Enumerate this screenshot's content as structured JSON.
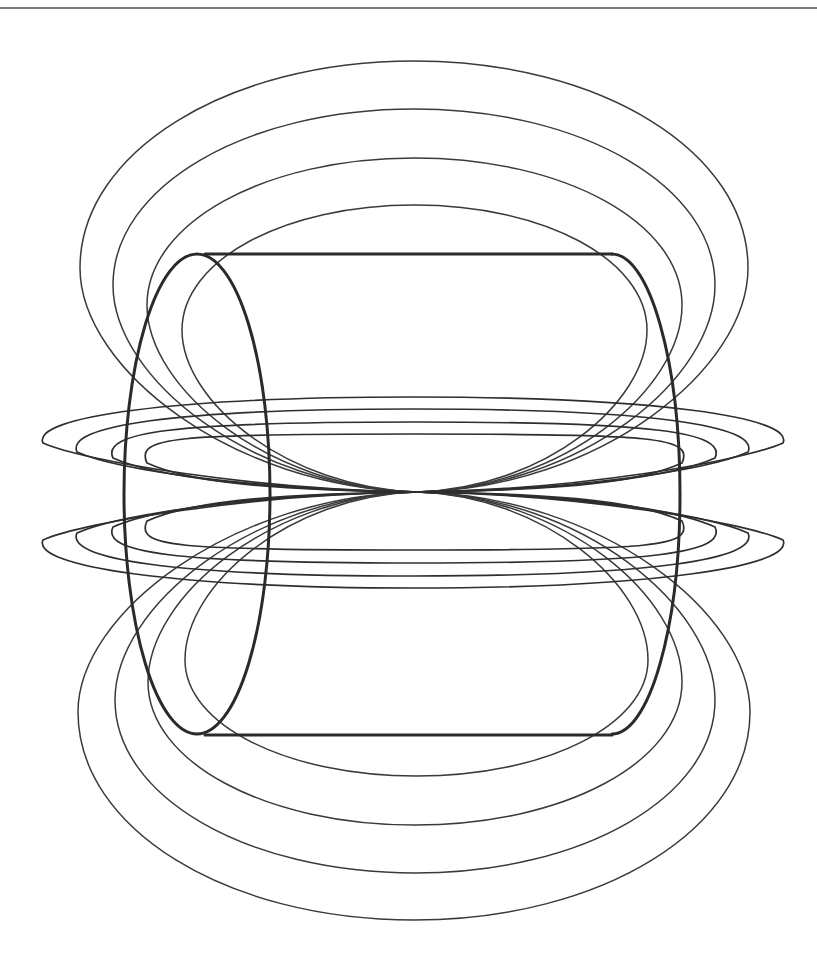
{
  "figure": {
    "width": 817,
    "height": 963,
    "stroke_color": "#2e2e2e",
    "background": "#ffffff"
  },
  "top_rule": {
    "y": 8,
    "x1": 0,
    "x2": 817
  },
  "pinch_point": {
    "x": 417,
    "y": 492
  },
  "cylinder": {
    "top_line": {
      "x1": 205,
      "x2": 612,
      "y": 254
    },
    "bottom_line": {
      "x1": 205,
      "x2": 612,
      "y": 735
    },
    "left_end": {
      "cx": 197,
      "cy": 494,
      "rx": 73,
      "ry": 240
    },
    "right_end": {
      "cx": 612,
      "cy": 494,
      "rx": 68,
      "ry": 240
    }
  },
  "upper_field_loops": [
    {
      "left": 80,
      "right": 748,
      "top": 61,
      "side_y": 268
    },
    {
      "left": 113,
      "right": 715,
      "top": 109,
      "side_y": 285
    },
    {
      "left": 147,
      "right": 682,
      "top": 158,
      "side_y": 305
    },
    {
      "left": 182,
      "right": 647,
      "top": 205,
      "side_y": 330
    }
  ],
  "lower_field_loops": [
    {
      "left": 78,
      "right": 750,
      "bottom": 920,
      "side_y": 712
    },
    {
      "left": 115,
      "right": 715,
      "bottom": 873,
      "side_y": 700
    },
    {
      "left": 148,
      "right": 682,
      "bottom": 825,
      "side_y": 682
    },
    {
      "left": 185,
      "right": 648,
      "bottom": 776,
      "side_y": 660
    }
  ],
  "upper_flat_loops": [
    {
      "left": 43,
      "right": 783,
      "top": 397,
      "tip_y": 443
    },
    {
      "left": 77,
      "right": 748,
      "top": 409,
      "tip_y": 452
    },
    {
      "left": 113,
      "right": 715,
      "top": 422,
      "tip_y": 458
    },
    {
      "left": 147,
      "right": 682,
      "top": 434,
      "tip_y": 463
    }
  ],
  "lower_flat_loops": [
    {
      "left": 43,
      "right": 783,
      "bottom": 588,
      "tip_y": 540
    },
    {
      "left": 77,
      "right": 748,
      "bottom": 576,
      "tip_y": 533
    },
    {
      "left": 113,
      "right": 715,
      "bottom": 563,
      "tip_y": 527
    },
    {
      "left": 147,
      "right": 682,
      "bottom": 550,
      "tip_y": 521
    }
  ]
}
